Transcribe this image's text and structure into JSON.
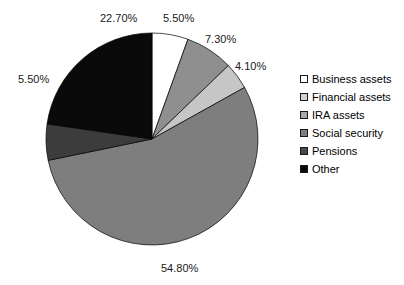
{
  "chart_data": {
    "type": "pie",
    "title": "",
    "categories": [
      "Business assets",
      "Financial assets",
      "IRA assets",
      "Social security",
      "Pensions",
      "Other"
    ],
    "values": [
      5.5,
      7.3,
      4.1,
      54.8,
      5.5,
      22.7
    ],
    "value_labels": [
      "5.50%",
      "7.30%",
      "4.10%",
      "54.80%",
      "5.50%",
      "22.70%"
    ],
    "unit": "%",
    "total": 99.9,
    "start_angle_deg": 0,
    "direction": "clockwise",
    "colors": [
      "#ffffff",
      "#8f8f8f",
      "#c6c6c6",
      "#7e7e7e",
      "#3c3c3c",
      "#0a0a0a"
    ],
    "legend_colors": [
      "#ffffff",
      "#d2d2d2",
      "#a8a8a8",
      "#7e7e7e",
      "#4a4a4a",
      "#0a0a0a"
    ],
    "legend_position": "right",
    "grid": false,
    "xlabel": "",
    "ylabel": ""
  },
  "labels": {
    "business_assets": "5.50%",
    "financial_assets": "7.30%",
    "ira_assets": "4.10%",
    "social_security": "54.80%",
    "pensions": "5.50%",
    "other": "22.70%"
  },
  "legend": {
    "items": [
      {
        "label": "Business assets",
        "color": "#ffffff"
      },
      {
        "label": "Financial assets",
        "color": "#d2d2d2"
      },
      {
        "label": "IRA assets",
        "color": "#a8a8a8"
      },
      {
        "label": "Social security",
        "color": "#7e7e7e"
      },
      {
        "label": "Pensions",
        "color": "#4a4a4a"
      },
      {
        "label": "Other",
        "color": "#0a0a0a"
      }
    ]
  },
  "title_remnant": ""
}
